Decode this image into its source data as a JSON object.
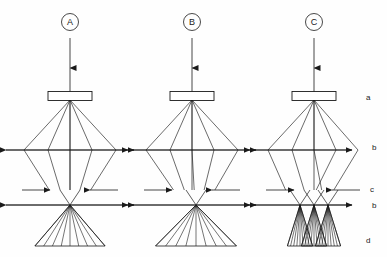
{
  "figure": {
    "type": "optical-ray-diagram",
    "background_color": "#fefefe",
    "line_color": "#1a1a1a",
    "width": 387,
    "height": 257
  },
  "panels": [
    {
      "id": "A",
      "label": "A",
      "label_style": "circled",
      "center_x": 70,
      "description": "symmetric single focus",
      "lens": {
        "name": "a",
        "x": 70,
        "y": 96,
        "width": 44,
        "height": 9
      },
      "source_point": {
        "x": 70,
        "y": 100
      },
      "incoming_beam": {
        "x": 70,
        "y_start": 38,
        "y_end": 92,
        "arrow_y": 68
      },
      "level_b_upper": {
        "y": 150,
        "x_left": 6,
        "x_right": 134
      },
      "level_c": {
        "y": 190,
        "plates": [
          {
            "x1": 22,
            "x2": 50,
            "arrow": "right"
          },
          {
            "x1": 90,
            "x2": 118,
            "arrow": "left"
          }
        ]
      },
      "level_b_lower": {
        "y": 205,
        "x_left": 6,
        "x_right": 134
      },
      "focus_points": [
        {
          "x": 70,
          "y": 205
        }
      ],
      "ray_envelope_x": [
        24,
        48,
        70,
        92,
        116
      ],
      "base_d": {
        "y": 246,
        "x_left": 44,
        "x_right": 96
      }
    },
    {
      "id": "B",
      "label": "B",
      "label_style": "circled",
      "center_x": 192,
      "description": "single focus shifted off axis, tilted fan",
      "lens": {
        "name": "a",
        "x": 192,
        "y": 96,
        "width": 44,
        "height": 9
      },
      "source_point": {
        "x": 192,
        "y": 100
      },
      "incoming_beam": {
        "x": 192,
        "y_start": 38,
        "y_end": 92,
        "arrow_y": 68
      },
      "level_b_upper": {
        "y": 150,
        "x_left": 128,
        "x_right": 256
      },
      "level_c": {
        "y": 190,
        "plates": [
          {
            "x1": 144,
            "x2": 172,
            "arrow": "right"
          },
          {
            "x1": 212,
            "x2": 240,
            "arrow": "left"
          }
        ]
      },
      "level_b_lower": {
        "y": 205,
        "x_left": 128,
        "x_right": 256
      },
      "focus_points": [
        {
          "x": 196,
          "y": 205
        }
      ],
      "ray_envelope_x": [
        146,
        170,
        192,
        214,
        238
      ],
      "base_d": {
        "y": 246,
        "x_left": 150,
        "x_right": 210
      }
    },
    {
      "id": "C",
      "label": "C",
      "label_style": "circled",
      "center_x": 314,
      "description": "three overlapping foci producing dense crosshatch",
      "lens": {
        "name": "a",
        "x": 314,
        "y": 96,
        "width": 44,
        "height": 9
      },
      "source_point": {
        "x": 314,
        "y": 100
      },
      "incoming_beam": {
        "x": 314,
        "y_start": 38,
        "y_end": 92,
        "arrow_y": 68
      },
      "level_b_upper": {
        "y": 150,
        "x_left": 250,
        "x_right": 352
      },
      "level_c": {
        "y": 190,
        "plates": [
          {
            "x1": 266,
            "x2": 294,
            "arrow": "right"
          },
          {
            "x1": 332,
            "x2": 360,
            "arrow": "left"
          }
        ]
      },
      "level_b_lower": {
        "y": 205,
        "x_left": 250,
        "x_right": 352
      },
      "focus_points": [
        {
          "x": 300,
          "y": 205
        },
        {
          "x": 314,
          "y": 205
        },
        {
          "x": 328,
          "y": 205
        }
      ],
      "ray_envelope_x": [
        268,
        292,
        314,
        336,
        358
      ],
      "base_d": {
        "y": 246,
        "x_left": 288,
        "x_right": 344
      }
    }
  ],
  "level_labels": [
    {
      "key": "a",
      "text": "a",
      "x": 366,
      "y": 100,
      "level": "lens"
    },
    {
      "key": "b_upper",
      "text": "b",
      "x": 372,
      "y": 150,
      "level": "upper reference plane"
    },
    {
      "key": "c",
      "text": "c",
      "x": 370,
      "y": 192,
      "level": "aperture plane"
    },
    {
      "key": "b_lower",
      "text": "b",
      "x": 372,
      "y": 208,
      "level": "lower reference plane"
    },
    {
      "key": "d",
      "text": "d",
      "x": 366,
      "y": 243,
      "level": "detector plane"
    }
  ]
}
